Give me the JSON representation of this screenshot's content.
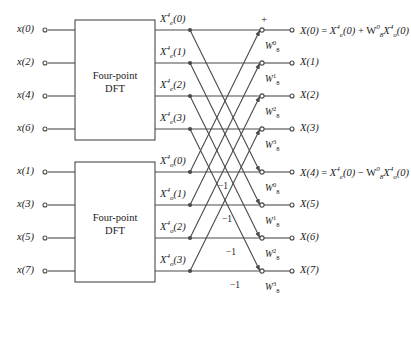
{
  "diagram": {
    "box_label_line1": "Four-point",
    "box_label_line2": "DFT",
    "plus_sign": "+",
    "minus_one": "−1",
    "colors": {
      "line": "#4a4a4a",
      "text": "#1a1a1a",
      "background": "#ffffff",
      "box_border": "#4a4a4a"
    }
  },
  "inputs": {
    "even": [
      {
        "label": "x(0)",
        "var": "x",
        "index": "0",
        "row": 0
      },
      {
        "label": "x(2)",
        "var": "x",
        "index": "2",
        "row": 1
      },
      {
        "label": "x(4)",
        "var": "x",
        "index": "4",
        "row": 2
      },
      {
        "label": "x(6)",
        "var": "x",
        "index": "6",
        "row": 3
      }
    ],
    "odd": [
      {
        "label": "x(1)",
        "var": "x",
        "index": "1",
        "row": 4
      },
      {
        "label": "x(3)",
        "var": "x",
        "index": "3",
        "row": 5
      },
      {
        "label": "x(5)",
        "var": "x",
        "index": "5",
        "row": 6
      },
      {
        "label": "x(7)",
        "var": "x",
        "index": "7",
        "row": 7
      }
    ]
  },
  "intermediate": {
    "even": [
      {
        "base": "X",
        "sub": "e",
        "sup": "4",
        "arg": "(0)",
        "row": 0
      },
      {
        "base": "X",
        "sub": "e",
        "sup": "4",
        "arg": "(1)",
        "row": 1
      },
      {
        "base": "X",
        "sub": "e",
        "sup": "4",
        "arg": "(2)",
        "row": 2
      },
      {
        "base": "X",
        "sub": "e",
        "sup": "4",
        "arg": "(3)",
        "row": 3
      }
    ],
    "odd": [
      {
        "base": "X",
        "sub": "o",
        "sup": "4",
        "arg": "(0)",
        "row": 4
      },
      {
        "base": "X",
        "sub": "o",
        "sup": "4",
        "arg": "(1)",
        "row": 5
      },
      {
        "base": "X",
        "sub": "o",
        "sup": "4",
        "arg": "(2)",
        "row": 6
      },
      {
        "base": "X",
        "sub": "o",
        "sup": "4",
        "arg": "(3)",
        "row": 7
      }
    ]
  },
  "twiddles": [
    {
      "base": "W",
      "sub": "8",
      "sup": "0",
      "row": 0
    },
    {
      "base": "W",
      "sub": "8",
      "sup": "1",
      "row": 1
    },
    {
      "base": "W",
      "sub": "8",
      "sup": "2",
      "row": 2
    },
    {
      "base": "W",
      "sub": "8",
      "sup": "3",
      "row": 3
    },
    {
      "base": "W",
      "sub": "8",
      "sup": "0",
      "row": 4
    },
    {
      "base": "W",
      "sub": "8",
      "sup": "1",
      "row": 5
    },
    {
      "base": "W",
      "sub": "8",
      "sup": "2",
      "row": 6
    },
    {
      "base": "W",
      "sub": "8",
      "sup": "3",
      "row": 7
    }
  ],
  "minus_ones": [
    {
      "text": "−1",
      "row": 4
    },
    {
      "text": "−1",
      "row": 5
    },
    {
      "text": "−1",
      "row": 6
    },
    {
      "text": "−1",
      "row": 7
    }
  ],
  "outputs": [
    {
      "label": "X(0)",
      "row": 0,
      "has_equation": true,
      "equation": "X(0) = X_e^4(0) + W_8^0 X_o^4(0)"
    },
    {
      "label": "X(1)",
      "row": 1,
      "has_equation": false,
      "equation": ""
    },
    {
      "label": "X(2)",
      "row": 2,
      "has_equation": false,
      "equation": ""
    },
    {
      "label": "X(3)",
      "row": 3,
      "has_equation": false,
      "equation": ""
    },
    {
      "label": "X(4)",
      "row": 4,
      "has_equation": true,
      "equation": "X(4) = X_e^4(0) − W_8^0 X_o^4(0)"
    },
    {
      "label": "X(5)",
      "row": 5,
      "has_equation": false,
      "equation": ""
    },
    {
      "label": "X(6)",
      "row": 6,
      "has_equation": false,
      "equation": ""
    },
    {
      "label": "X(7)",
      "row": 7,
      "has_equation": false,
      "equation": ""
    }
  ]
}
